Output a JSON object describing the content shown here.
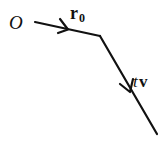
{
  "diagram": {
    "type": "vector-addition",
    "stroke_color": "#111111",
    "background": "#ffffff",
    "labels": {
      "origin": "O",
      "r0_main": "r",
      "r0_sub": "0",
      "tv_t": "t",
      "tv_v": "v"
    },
    "segments": [
      {
        "name": "r0",
        "from": [
          35,
          22
        ],
        "to": [
          100,
          36
        ],
        "arrow_at": [
          66,
          29
        ]
      },
      {
        "name": "tv",
        "from": [
          100,
          36
        ],
        "to": [
          157,
          134
        ],
        "arrow_at": [
          130,
          90
        ]
      }
    ]
  }
}
